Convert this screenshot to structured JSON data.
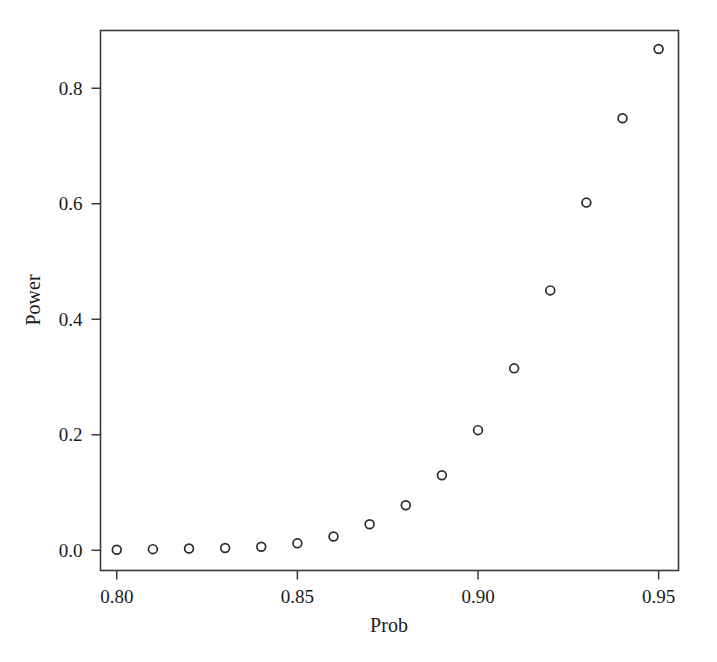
{
  "chart_data": {
    "type": "scatter",
    "title": "",
    "xlabel": "Prob",
    "ylabel": "Power",
    "xlim": [
      0.7955,
      0.9555
    ],
    "ylim": [
      -0.035,
      0.9
    ],
    "grid": false,
    "legend": null,
    "marker": "open-circle",
    "marker_color": "#2b2b2b",
    "x_ticks": [
      0.8,
      0.85,
      0.9,
      0.95
    ],
    "x_tick_labels": [
      "0.80",
      "0.85",
      "0.90",
      "0.95"
    ],
    "y_ticks": [
      0.0,
      0.2,
      0.4,
      0.6,
      0.8
    ],
    "y_tick_labels": [
      "0.0",
      "0.2",
      "0.4",
      "0.6",
      "0.8"
    ],
    "x": [
      0.8,
      0.81,
      0.82,
      0.83,
      0.84,
      0.85,
      0.86,
      0.87,
      0.88,
      0.89,
      0.9,
      0.91,
      0.92,
      0.93,
      0.94,
      0.95
    ],
    "values": [
      0.001,
      0.002,
      0.003,
      0.004,
      0.006,
      0.012,
      0.024,
      0.045,
      0.078,
      0.13,
      0.208,
      0.315,
      0.45,
      0.602,
      0.748,
      0.868
    ],
    "points": [
      {
        "x": 0.8,
        "y": 0.001
      },
      {
        "x": 0.81,
        "y": 0.002
      },
      {
        "x": 0.82,
        "y": 0.003
      },
      {
        "x": 0.83,
        "y": 0.004
      },
      {
        "x": 0.84,
        "y": 0.006
      },
      {
        "x": 0.85,
        "y": 0.012
      },
      {
        "x": 0.86,
        "y": 0.024
      },
      {
        "x": 0.87,
        "y": 0.045
      },
      {
        "x": 0.88,
        "y": 0.078
      },
      {
        "x": 0.89,
        "y": 0.13
      },
      {
        "x": 0.9,
        "y": 0.208
      },
      {
        "x": 0.91,
        "y": 0.315
      },
      {
        "x": 0.92,
        "y": 0.45
      },
      {
        "x": 0.93,
        "y": 0.602
      },
      {
        "x": 0.94,
        "y": 0.748
      },
      {
        "x": 0.95,
        "y": 0.868
      }
    ]
  },
  "figure": {
    "background_color": "#ffffff",
    "axis_color": "#3a3a3a",
    "text_color": "#1a1a1a"
  }
}
